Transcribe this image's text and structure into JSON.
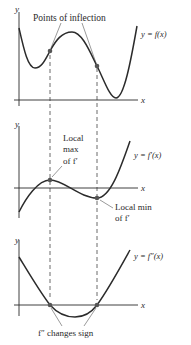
{
  "panels": [
    {
      "id": "f",
      "curve_label": "y = f(x)",
      "y_axis_label": "y",
      "x_axis_label": "x",
      "annotation": "Points of inflection"
    },
    {
      "id": "f_prime",
      "curve_label": "y = f′(x)",
      "y_axis_label": "y",
      "x_axis_label": "x",
      "annotation_max": [
        "Local",
        "max",
        "of f′"
      ],
      "annotation_min": [
        "Local min",
        "of f′"
      ]
    },
    {
      "id": "f_double_prime",
      "curve_label": "y = f″(x)",
      "y_axis_label": "y",
      "x_axis_label": "x",
      "annotation": "f″ changes sign"
    }
  ],
  "colors": {
    "curve": "#2b2b2b",
    "point": "#555555",
    "axis": "#2b2b2b",
    "dashed": "#444444"
  }
}
